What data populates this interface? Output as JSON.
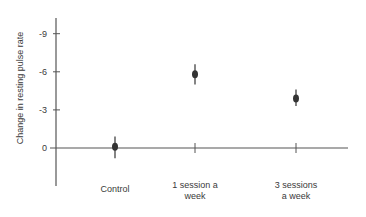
{
  "chart_data": {
    "type": "scatter",
    "title": "",
    "xlabel": "",
    "ylabel": "Change in resting pulse rate",
    "y_ticks": [
      "-9",
      "-6",
      "-3",
      "0"
    ],
    "y_tick_values": [
      -9,
      -6,
      -3,
      0
    ],
    "ylim": [
      2.5,
      -10.5
    ],
    "y_inverted": true,
    "grid": false,
    "legend": null,
    "categories": [
      "Control",
      "1 session a week",
      "3 sessions a week"
    ],
    "category_lines": [
      [
        "Control"
      ],
      [
        "1 session a",
        "week"
      ],
      [
        "3 sessions",
        "a week"
      ]
    ],
    "values": [
      -0.1,
      -5.8,
      -3.9
    ],
    "error_low": [
      0.8,
      -5.0,
      -3.3
    ],
    "error_high": [
      -0.9,
      -6.6,
      -4.6
    ]
  },
  "colors": {
    "axis": "#555555",
    "point": "#333333",
    "text": "#3a3a3a"
  }
}
